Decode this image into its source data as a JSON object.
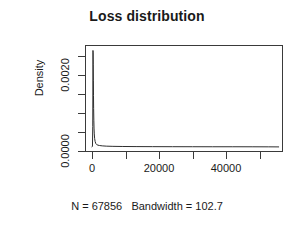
{
  "chart_data": {
    "type": "line",
    "title": "Loss distribution",
    "xlabel": "N = 67856   Bandwidth = 102.7",
    "ylabel": "Density",
    "xlim": [
      -2100,
      57000
    ],
    "ylim": [
      -0.00012,
      0.00295
    ],
    "grid": false,
    "legend": null,
    "x_ticks": [
      0,
      10000,
      20000,
      30000,
      40000,
      50000
    ],
    "x_tick_labels": [
      "0",
      "",
      "20000",
      "",
      "40000",
      ""
    ],
    "y_ticks": [
      0.0,
      0.0005,
      0.001,
      0.0015,
      0.002,
      0.0025
    ],
    "y_tick_labels": [
      "0.0000",
      "",
      "",
      "",
      "0.0020",
      ""
    ],
    "series": [
      {
        "name": "Density",
        "x": [
          -300,
          -150,
          -60,
          0,
          40,
          80,
          120,
          160,
          200,
          260,
          320,
          400,
          500,
          650,
          850,
          1100,
          1500,
          2000,
          2800,
          4000,
          6000,
          9000,
          13000,
          18000,
          24000,
          30000,
          36000,
          42000,
          48000,
          53000,
          56000
        ],
        "y": [
          0.0,
          2e-05,
          0.0006,
          0.00282,
          0.00275,
          0.0024,
          0.00195,
          0.0015,
          0.00112,
          0.00078,
          0.00055,
          0.00038,
          0.00025,
          0.00016,
          0.0001,
          7e-05,
          5e-05,
          4e-05,
          3e-05,
          2.2e-05,
          1.6e-05,
          1.2e-05,
          9e-06,
          7e-06,
          6e-06,
          5e-06,
          4e-06,
          4e-06,
          3e-06,
          2e-06,
          0.0
        ]
      }
    ]
  },
  "title": {
    "text": "Loss distribution"
  },
  "axes": {
    "y_title": "Density",
    "caption": "N = 67856   Bandwidth = 102.7",
    "y_tick_labels": [
      {
        "value": "0.0000"
      },
      {
        "value": "0.0020"
      }
    ],
    "x_tick_labels": [
      {
        "value": "0"
      },
      {
        "value": "20000"
      },
      {
        "value": "40000"
      }
    ]
  },
  "colors": {
    "axis": "#3a3a3a",
    "line": "#2b2b2b",
    "text": "#1a1a1a",
    "background": "#ffffff"
  }
}
